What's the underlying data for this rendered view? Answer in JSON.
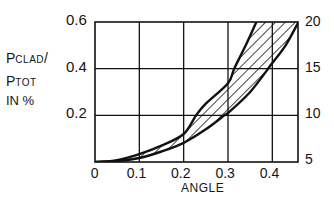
{
  "chart_data": {
    "type": "area",
    "title": "",
    "xlabel": "ANGLE",
    "ylabel": "P_CLAD / P_TOT IN %",
    "ylabel_parts": {
      "line1_main": "P",
      "line1_sub": "CLAD",
      "line1_suffix": "/",
      "line2_main": "P",
      "line2_sub": "TOT",
      "line3": "IN %"
    },
    "x_ticks": [
      "0",
      "0.1",
      "0.2",
      "0.3",
      "0.4"
    ],
    "x_tick_values": [
      0,
      0.1,
      0.2,
      0.3,
      0.4
    ],
    "y_ticks_left": [
      "0.2",
      "0.4",
      "0.6"
    ],
    "y_tick_values_left": [
      0.2,
      0.4,
      0.6
    ],
    "y_ticks_right": [
      "5",
      "10",
      "15",
      "20"
    ],
    "y_tick_values_right": [
      5,
      10,
      15,
      20
    ],
    "xlim": [
      0,
      0.46
    ],
    "ylim": [
      0,
      0.6
    ],
    "ylim_right": [
      5,
      20
    ],
    "grid": true,
    "legend": null,
    "series": [
      {
        "name": "upper bound",
        "x": [
          0,
          0.05,
          0.1,
          0.15,
          0.2,
          0.228,
          0.25,
          0.3,
          0.314,
          0.34,
          0.364
        ],
        "values": [
          0,
          0.008,
          0.034,
          0.07,
          0.12,
          0.2,
          0.25,
          0.338,
          0.4,
          0.5,
          0.6
        ]
      },
      {
        "name": "lower bound",
        "x": [
          0,
          0.05,
          0.1,
          0.15,
          0.2,
          0.25,
          0.292,
          0.3,
          0.35,
          0.4,
          0.43,
          0.459
        ],
        "values": [
          0,
          0.004,
          0.017,
          0.045,
          0.082,
          0.14,
          0.2,
          0.21,
          0.3,
          0.424,
          0.5,
          0.6
        ]
      }
    ],
    "annotation": "hatched band between the two curves"
  }
}
